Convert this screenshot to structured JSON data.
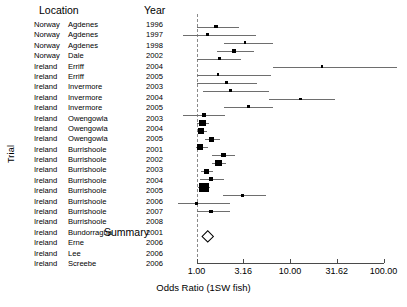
{
  "headers": {
    "location": "Location",
    "year": "Year"
  },
  "axis": {
    "ylabel": "Trial",
    "xlabel": "Odds Ratio (1SW fish)",
    "ticks": [
      "1.00",
      "3.16",
      "10.00",
      "31.62",
      "100.00"
    ],
    "tick_values": [
      1.0,
      3.16,
      10.0,
      31.62,
      100.0
    ],
    "null_value": 1.0
  },
  "summary_label": "Summary",
  "colors": {
    "point": "#000000",
    "ci_line": "#6e6e6e",
    "null_line": "#8a8a8a",
    "axis": "#4a4a4a",
    "text": "#000000",
    "background": "#ffffff"
  },
  "chart_data": {
    "type": "forest",
    "title": "",
    "xlabel": "Odds Ratio (1SW fish)",
    "ylabel": "Trial",
    "xscale": "log",
    "xlim": [
      1.0,
      100.0
    ],
    "xticks": [
      1.0,
      3.16,
      10.0,
      31.62,
      100.0
    ],
    "xticklabels": [
      "1.00",
      "3.16",
      "10.00",
      "31.62",
      "100.00"
    ],
    "reference_line": 1.0,
    "grid": false,
    "legend": "none",
    "columns": [
      "Country",
      "Place",
      "Year",
      "Odds Ratio",
      "CI Low",
      "CI High",
      "Weight"
    ],
    "rows": [
      {
        "country": "Norway",
        "place": "Agdenes",
        "year": "1996",
        "or": 1.62,
        "lo": 1.0,
        "hi": 2.85,
        "weight": 0.14
      },
      {
        "country": "Norway",
        "place": "Agdenes",
        "year": "1997",
        "or": 1.3,
        "lo": 0.72,
        "hi": 4.3,
        "weight": 0.07
      },
      {
        "country": "Norway",
        "place": "Agdenes",
        "year": "1998",
        "or": 3.3,
        "lo": 1.95,
        "hi": 6.6,
        "weight": 0.1
      },
      {
        "country": "Norway",
        "place": "Dale",
        "year": "2002",
        "or": 2.5,
        "lo": 1.65,
        "hi": 4.1,
        "weight": 0.22
      },
      {
        "country": "Ireland",
        "place": "Erriff",
        "year": "2004",
        "or": 1.75,
        "lo": 1.0,
        "hi": 3.0,
        "weight": 0.16
      },
      {
        "country": "Ireland",
        "place": "Erriff",
        "year": "2005",
        "or": 22.0,
        "lo": 6.6,
        "hi": 140.0,
        "weight": 0.06
      },
      {
        "country": "Ireland",
        "place": "Invermore",
        "year": "2003",
        "or": 1.7,
        "lo": 1.0,
        "hi": 6.3,
        "weight": 0.07
      },
      {
        "country": "Ireland",
        "place": "Invermore",
        "year": "2004",
        "or": 2.1,
        "lo": 1.0,
        "hi": 4.4,
        "weight": 0.09
      },
      {
        "country": "Ireland",
        "place": "Invermore",
        "year": "2005",
        "or": 2.3,
        "lo": 1.18,
        "hi": 6.0,
        "weight": 0.09
      },
      {
        "country": "Ireland",
        "place": "Owengowla",
        "year": "2003",
        "or": 13.0,
        "lo": 6.0,
        "hi": 30.0,
        "weight": 0.07
      },
      {
        "country": "Ireland",
        "place": "Owengowla",
        "year": "2004",
        "or": 3.6,
        "lo": 1.95,
        "hi": 6.6,
        "weight": 0.12
      },
      {
        "country": "Ireland",
        "place": "Owengowla",
        "year": "2005",
        "or": 1.2,
        "lo": 0.72,
        "hi": 2.0,
        "weight": 0.14
      },
      {
        "country": "Ireland",
        "place": "Burrishoole",
        "year": "2001",
        "or": 1.15,
        "lo": 1.02,
        "hi": 1.35,
        "weight": 0.62
      },
      {
        "country": "Ireland",
        "place": "Burrishoole",
        "year": "2002",
        "or": 1.12,
        "lo": 1.0,
        "hi": 1.3,
        "weight": 0.58
      },
      {
        "country": "Ireland",
        "place": "Burrishoole",
        "year": "2003",
        "or": 1.45,
        "lo": 1.22,
        "hi": 1.8,
        "weight": 0.4
      },
      {
        "country": "Ireland",
        "place": "Burrishoole",
        "year": "2004",
        "or": 1.1,
        "lo": 0.98,
        "hi": 1.32,
        "weight": 0.52
      },
      {
        "country": "Ireland",
        "place": "Burrishoole",
        "year": "2005",
        "or": 1.95,
        "lo": 1.45,
        "hi": 2.6,
        "weight": 0.3
      },
      {
        "country": "Ireland",
        "place": "Burrishoole",
        "year": "2006",
        "or": 1.72,
        "lo": 1.45,
        "hi": 2.05,
        "weight": 0.56
      },
      {
        "country": "Ireland",
        "place": "Burrishoole",
        "year": "2007",
        "or": 1.28,
        "lo": 1.12,
        "hi": 1.5,
        "weight": 0.42
      },
      {
        "country": "Ireland",
        "place": "Burrishoole",
        "year": "2008",
        "or": 1.42,
        "lo": 1.1,
        "hi": 1.95,
        "weight": 0.3
      },
      {
        "country": "Ireland",
        "place": "Bundorragha",
        "year": "2001",
        "or": 1.2,
        "lo": 1.05,
        "hi": 1.4,
        "weight": 1.0
      },
      {
        "country": "Ireland",
        "place": "Erne",
        "year": "2006",
        "or": 3.1,
        "lo": 1.9,
        "hi": 5.6,
        "weight": 0.15
      },
      {
        "country": "Ireland",
        "place": "Lee",
        "year": "2006",
        "or": 1.0,
        "lo": 0.3,
        "hi": 2.3,
        "weight": 0.1
      },
      {
        "country": "Ireland",
        "place": "Screebe",
        "year": "2006",
        "or": 1.42,
        "lo": 1.0,
        "hi": 2.3,
        "weight": 0.22
      }
    ],
    "summary": {
      "label": "Summary",
      "or": 1.3,
      "lo": 1.14,
      "hi": 1.48
    }
  }
}
